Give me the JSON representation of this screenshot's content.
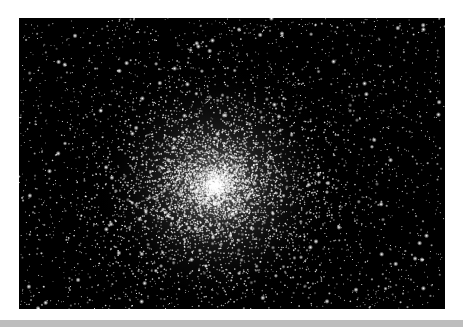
{
  "image": {
    "subject": "globular star cluster",
    "alt": "Dense globular star cluster against black sky",
    "background_color": "#000000",
    "star_color": "#ffffff",
    "cluster_center": [
      196,
      167
    ],
    "frame": {
      "x": 19,
      "y": 18,
      "width": 426,
      "height": 291
    }
  },
  "page": {
    "background_color": "#ffffff",
    "bottom_bar_color": "#bdbdbd"
  }
}
